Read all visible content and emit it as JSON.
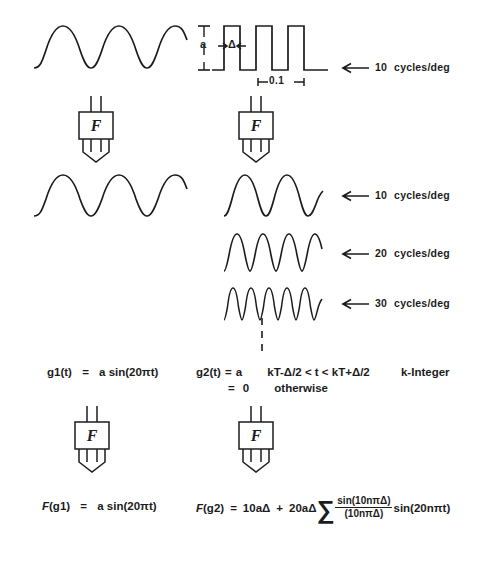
{
  "figure": {
    "stroke_color": "#1c1c1c",
    "background_color": "#ffffff"
  },
  "operator": {
    "symbol": "F",
    "name": "fourier-transform-operator"
  },
  "left_column": {
    "input_wave": {
      "type": "sine",
      "cycles": 3
    },
    "output_wave": {
      "type": "sine",
      "cycles": 3
    },
    "equation_input": {
      "lhs": "g1(t)",
      "eq": "=",
      "rhs": "a  sin(20πt)"
    },
    "equation_output": {
      "lhs_italic": "F",
      "lhs_rest": "(g1)",
      "eq": "=",
      "rhs": "a  sin(20πt)"
    }
  },
  "right_column": {
    "input_wave": {
      "type": "square",
      "cycles": 3
    },
    "amplitude_label": "a",
    "pulse_width_label": "Δ",
    "period_label": "0.1",
    "harmonics": [
      {
        "frequency": "10",
        "unit": "cycles/deg",
        "cycles": 3
      },
      {
        "frequency": "20",
        "unit": "cycles/deg",
        "cycles": 6
      },
      {
        "frequency": "30",
        "unit": "cycles/deg",
        "cycles": 9
      }
    ],
    "continuation": "vertical-dashed-line",
    "input_frequency_label": {
      "frequency": "10",
      "unit": "cycles/deg"
    },
    "equation_input": {
      "lhs": "g2(t)",
      "eq1": "=",
      "val1": "a",
      "cond1": "kT-Δ/2  <  t  <  kT+Δ/2",
      "note": "k-Integer",
      "eq2": "=",
      "val2": "0",
      "cond2": "otherwise"
    },
    "equation_output": {
      "lhs_italic": "F",
      "lhs_rest": "(g2)",
      "eq": "=",
      "term1": "10aΔ",
      "plus": "+",
      "term2": "20aΔ",
      "sum": "∑",
      "frac_num": "sin(10nπΔ)",
      "frac_den": "(10nπΔ)",
      "term3": "sin(20nπt)"
    }
  }
}
